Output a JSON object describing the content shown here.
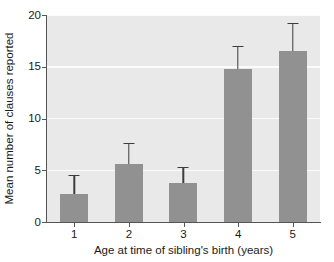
{
  "chart_data": {
    "type": "bar",
    "title": "",
    "subtitle": "",
    "xlabel": "Age at time of sibling's birth (years)",
    "ylabel": "Mean number of clauses reported",
    "categories": [
      "1",
      "2",
      "3",
      "4",
      "5"
    ],
    "values": [
      2.7,
      5.6,
      3.8,
      14.8,
      16.5
    ],
    "errors": [
      1.75,
      1.9,
      1.4,
      2.1,
      2.6
    ],
    "error_upper": [
      4.45,
      7.5,
      5.2,
      16.9,
      19.1
    ],
    "ylim": [
      0,
      20
    ],
    "yticks": [
      0,
      5,
      10,
      15,
      20
    ],
    "ytick_labels": [
      "0",
      "5",
      "10",
      "15",
      "20"
    ],
    "xtick_labels": [
      "1",
      "2",
      "3",
      "4",
      "5"
    ],
    "grid": true,
    "grid_axis": "y",
    "legend": false,
    "legend_position": "none",
    "bar_color": "#919191",
    "error_color": "#3d3d3d",
    "plot_background": "#e9e9e9",
    "gridline_color": "#fbfbfb",
    "axis_color": "#555555",
    "text_color": "#1a1a1a",
    "figure_background": "#ffffff"
  }
}
